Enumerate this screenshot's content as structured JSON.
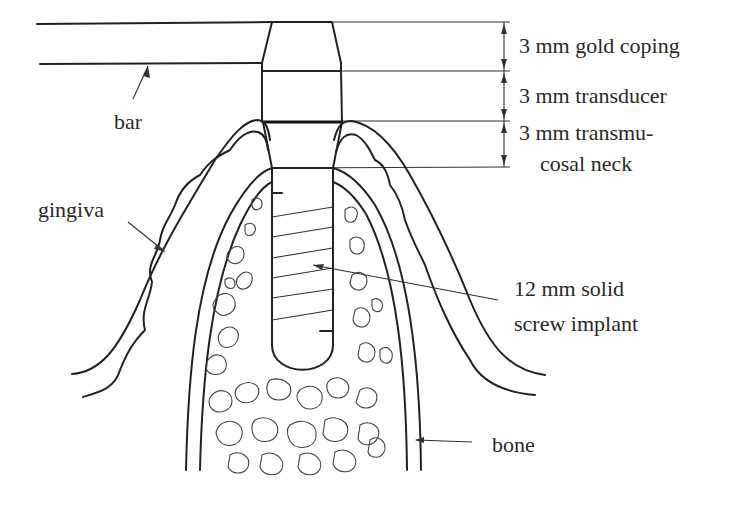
{
  "figure": {
    "type": "dental implant cross-section schematic",
    "labels": {
      "gold_coping": "3 mm gold coping",
      "transducer": "3 mm transducer",
      "transmucosal_line1": "3 mm transmu-",
      "transmucosal_line2": "cosal neck",
      "bar": "bar",
      "gingiva": "gingiva",
      "implant_line1": "12 mm solid",
      "implant_line2": "screw implant",
      "bone": "bone"
    },
    "dimensions": [
      {
        "segment": "gold coping",
        "length_mm": 3
      },
      {
        "segment": "transducer",
        "length_mm": 3
      },
      {
        "segment": "transmucosal neck",
        "length_mm": 3
      },
      {
        "segment": "solid screw implant",
        "length_mm": 12
      }
    ],
    "colors": {
      "line": "#222222",
      "text": "#2a2a2a",
      "background": "#ffffff"
    }
  }
}
